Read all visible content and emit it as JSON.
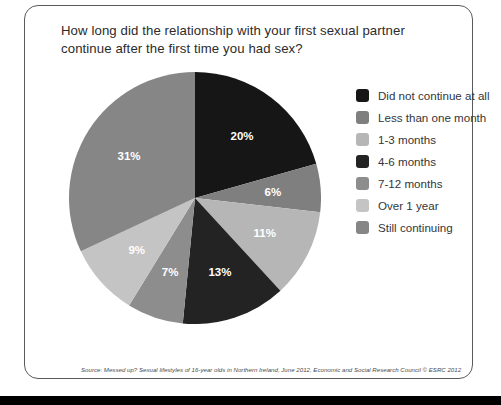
{
  "card": {
    "title": "How long did the relationship with your first sexual partner continue after the first time you had sex?",
    "source": "Source: Messed up? Sexual lifestyles of 16-year olds in Northern Ireland, June 2012, Economic and Social Research Council © ESRC 2012"
  },
  "legend": {
    "items": [
      {
        "label": "Did not continue at all",
        "color": "#161616"
      },
      {
        "label": "Less than one month",
        "color": "#7f7f7f"
      },
      {
        "label": "1-3 months",
        "color": "#b6b6b6"
      },
      {
        "label": "4-6 months",
        "color": "#232323"
      },
      {
        "label": "7-12 months",
        "color": "#8d8d8d"
      },
      {
        "label": "Over 1 year",
        "color": "#c4c4c4"
      },
      {
        "label": "Still continuing",
        "color": "#868686"
      }
    ]
  },
  "chart_data": {
    "type": "pie",
    "title": "How long did the relationship with your first sexual partner continue after the first time you had sex?",
    "categories": [
      "Did not continue at all",
      "Less than one month",
      "1-3 months",
      "4-6 months",
      "7-12 months",
      "Over 1 year",
      "Still continuing"
    ],
    "values": [
      20,
      6,
      11,
      13,
      7,
      9,
      31
    ],
    "value_labels": [
      "20%",
      "6%",
      "11%",
      "13%",
      "7%",
      "9%",
      "31%"
    ],
    "colors": [
      "#161616",
      "#7f7f7f",
      "#b6b6b6",
      "#232323",
      "#8d8d8d",
      "#c4c4c4",
      "#868686"
    ],
    "units": "percent",
    "start_angle_deg": 0,
    "direction": "clockwise",
    "legend_position": "right",
    "data_label_color": "#ffffff",
    "total": 97
  }
}
